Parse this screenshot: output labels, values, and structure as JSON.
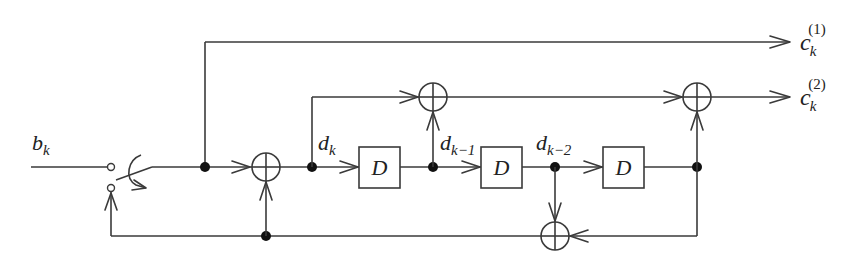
{
  "diagram": {
    "type": "convolutional-encoder-block-diagram",
    "input": {
      "label": "b",
      "subscript": "k"
    },
    "outputs": [
      {
        "label": "c",
        "subscript": "k",
        "superscript": "(1)"
      },
      {
        "label": "c",
        "subscript": "k",
        "superscript": "(2)"
      }
    ],
    "delay_blocks": [
      {
        "label": "D"
      },
      {
        "label": "D"
      },
      {
        "label": "D"
      }
    ],
    "signals": [
      {
        "label": "d",
        "subscript": "k"
      },
      {
        "label": "d",
        "subscript": "k−1"
      },
      {
        "label": "d",
        "subscript": "k−2"
      }
    ],
    "adders": [
      {
        "id": "input-adder",
        "symbol": "⊕"
      },
      {
        "id": "top-adder",
        "symbol": "⊕"
      },
      {
        "id": "output-adder",
        "symbol": "⊕"
      },
      {
        "id": "feedback-adder",
        "symbol": "⊕"
      }
    ],
    "switch": {
      "semantic": "input/termination switch"
    }
  },
  "colors": {
    "line": "#3a3a3a",
    "dot": "#111111",
    "background": "#ffffff"
  }
}
